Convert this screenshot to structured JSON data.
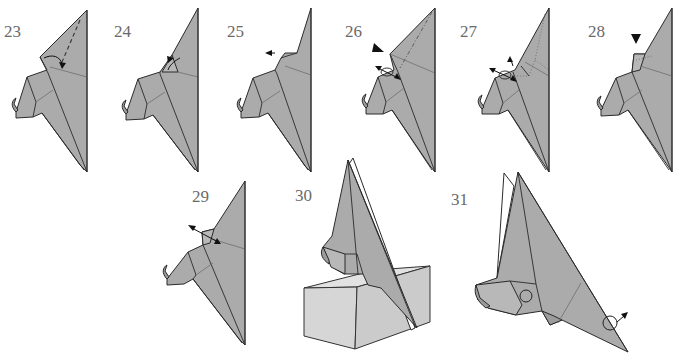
{
  "diagram": {
    "type": "origami-instructions",
    "steps": [
      {
        "number": "23",
        "action": "valley-fold",
        "symbols": [
          "valley-line",
          "fold-arrow"
        ]
      },
      {
        "number": "24",
        "action": "unfold",
        "symbols": [
          "unfold-arrow"
        ]
      },
      {
        "number": "25",
        "action": "pull-out",
        "symbols": [
          "pull-arrow"
        ]
      },
      {
        "number": "26",
        "action": "push-in",
        "symbols": [
          "push-arrow",
          "pivot-circle",
          "mountain-line"
        ]
      },
      {
        "number": "27",
        "action": "reverse-fold",
        "symbols": [
          "pivot-circle",
          "dotted-hidden-lines",
          "pull-arrow"
        ]
      },
      {
        "number": "28",
        "action": "push-in",
        "symbols": [
          "push-arrow",
          "dotted-hidden-lines"
        ]
      },
      {
        "number": "29",
        "action": "pull-and-fold",
        "symbols": [
          "two-way-arrow"
        ]
      },
      {
        "number": "30",
        "action": "stand-on-perch",
        "symbols": [
          "box"
        ]
      },
      {
        "number": "31",
        "action": "finished-model",
        "symbols": [
          "eye-circle",
          "pivot-circle",
          "rotate-arrow"
        ]
      }
    ]
  },
  "colors": {
    "paper": "#ababab",
    "outline": "#2a2a2a",
    "box": "#d6d6d6",
    "label": "#6a6a6a",
    "background": "#ffffff"
  }
}
